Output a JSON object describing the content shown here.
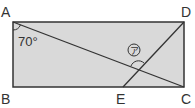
{
  "diagram": {
    "type": "geometry-rectangle",
    "points": {
      "A": {
        "label": "A"
      },
      "B": {
        "label": "B"
      },
      "C": {
        "label": "C"
      },
      "D": {
        "label": "D"
      },
      "E": {
        "label": "E"
      }
    },
    "angle_given": "70°",
    "angle_unknown": "ア",
    "colors": {
      "fill": "#d9d9d9",
      "stroke": "#333333",
      "background": "#ffffff"
    }
  }
}
